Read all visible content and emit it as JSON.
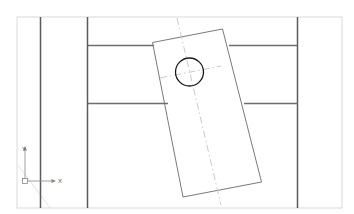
{
  "drawing": {
    "title": "Orthographic part view with rotated plate",
    "type": "cad-2d-orthographic-view",
    "units": "mm",
    "background_color": "#ffffff",
    "canvas": {
      "width": 354,
      "height": 214
    },
    "colors": {
      "frame_line": "#cfcfcf",
      "heavy_line": "#4a4a4a",
      "medium_line": "#6e6e6e",
      "thin_line": "#8f8f8f",
      "object_line": "#7a7a7a",
      "circle_line": "#1a1a1a",
      "center_line": "#c4c4c4",
      "construction_line": "#d8d8d8",
      "ucs_icon": "#888888",
      "ucs_label": "#555555"
    },
    "frame": {
      "name": "drawing-border",
      "x": 17,
      "y": 17,
      "width": 325,
      "height": 191,
      "stroke": "#cfcfcf",
      "stroke_width": 0.8
    },
    "vertical_lines": [
      {
        "name": "left-edge-line",
        "x": 40.5,
        "y1": 17,
        "y2": 208,
        "stroke": "#5a5a5a",
        "stroke_width": 1.5
      },
      {
        "name": "left-inner-line",
        "x": 87.5,
        "y1": 17,
        "y2": 208,
        "stroke": "#5a5a5a",
        "stroke_width": 1.5
      },
      {
        "name": "right-inner-line",
        "x": 297.5,
        "y1": 17,
        "y2": 208,
        "stroke": "#5a5a5a",
        "stroke_width": 1.5
      }
    ],
    "horizontal_lines": [
      {
        "name": "upper-step-line-left",
        "x1": 87.5,
        "x2": 154,
        "y": 45.5,
        "stroke": "#6e6e6e",
        "stroke_width": 1.4
      },
      {
        "name": "upper-step-line-right",
        "x1": 229,
        "x2": 297.5,
        "y": 45.5,
        "stroke": "#6e6e6e",
        "stroke_width": 1.4
      },
      {
        "name": "lower-step-line-left",
        "x1": 87.5,
        "x2": 168,
        "y": 103.5,
        "stroke": "#6e6e6e",
        "stroke_width": 1.4
      },
      {
        "name": "lower-step-line-right",
        "x1": 244,
        "x2": 297.5,
        "y": 103.5,
        "stroke": "#6e6e6e",
        "stroke_width": 1.4
      }
    ],
    "rotated_plate": {
      "name": "rotated-rectangular-plate",
      "rotation_deg": 11,
      "corners": [
        {
          "x": 152.5,
          "y": 42.5
        },
        {
          "x": 222.5,
          "y": 29.0
        },
        {
          "x": 261.5,
          "y": 182.0
        },
        {
          "x": 183.0,
          "y": 197.0
        }
      ],
      "stroke": "#7a7a7a",
      "stroke_width": 1.0,
      "fill": "none"
    },
    "circle": {
      "name": "center-hole",
      "cx": 189.5,
      "cy": 72.0,
      "r": 14.0,
      "stroke": "#1a1a1a",
      "stroke_width": 1.3,
      "fill": "none"
    },
    "center_lines": [
      {
        "name": "plate-long-centerline",
        "x1": 177.0,
        "y1": 18.0,
        "x2": 221.0,
        "y2": 205.0,
        "stroke": "#c4c4c4",
        "stroke_width": 0.9,
        "dash": "7 3 1.5 3"
      },
      {
        "name": "hole-horizontal-centerline",
        "x1": 160.0,
        "y1": 78.0,
        "x2": 221.0,
        "y2": 66.0,
        "stroke": "#c4c4c4",
        "stroke_width": 0.9,
        "dash": "7 3 1.5 3"
      }
    ],
    "construction_lines": [
      {
        "name": "lower-left-construction-line",
        "x1": 18.0,
        "y1": 165.0,
        "x2": 50.0,
        "y2": 208.0,
        "stroke": "#dcdcdc",
        "stroke_width": 0.8
      }
    ],
    "ucs_icon": {
      "name": "ucs-coordinate-icon",
      "origin": {
        "x": 25.0,
        "y": 181.0
      },
      "box_size": 5,
      "x_axis": {
        "length": 28,
        "label": "X",
        "label_x": 58,
        "label_y": 183
      },
      "y_axis": {
        "length": 32,
        "label": "Y",
        "label_x": 22,
        "label_y": 151
      },
      "stroke": "#888888",
      "stroke_width": 0.8,
      "label_color": "#555555",
      "label_font_size": 6
    }
  }
}
